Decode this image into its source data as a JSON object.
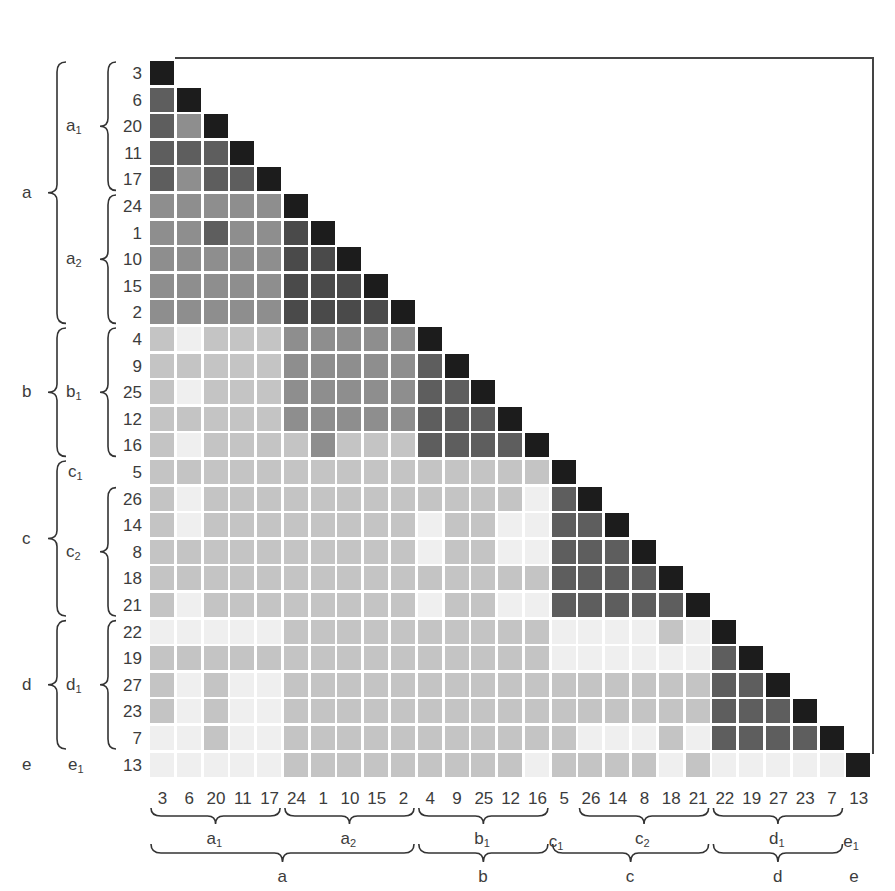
{
  "chart_data": {
    "type": "heatmap",
    "title": "",
    "subtitle": "",
    "order": [
      "3",
      "6",
      "20",
      "11",
      "17",
      "24",
      "1",
      "10",
      "15",
      "2",
      "4",
      "9",
      "25",
      "12",
      "16",
      "5",
      "26",
      "14",
      "8",
      "18",
      "21",
      "22",
      "19",
      "27",
      "23",
      "7",
      "13"
    ],
    "row_labels": [
      "3",
      "6",
      "20",
      "11",
      "17",
      "24",
      "1",
      "10",
      "15",
      "2",
      "4",
      "9",
      "25",
      "12",
      "16",
      "5",
      "26",
      "14",
      "8",
      "18",
      "21",
      "22",
      "19",
      "27",
      "23",
      "7",
      "13"
    ],
    "col_labels": [
      "3",
      "6",
      "20",
      "11",
      "17",
      "24",
      "1",
      "10",
      "15",
      "2",
      "4",
      "9",
      "25",
      "12",
      "16",
      "5",
      "26",
      "14",
      "8",
      "18",
      "21",
      "22",
      "19",
      "27",
      "23",
      "7",
      "13"
    ],
    "shade_scale": {
      "0": "#efefef",
      "1": "#c4c4c4",
      "3": "#8e8e8e",
      "4": "#5e5e5e",
      "5": "#4a4a4a",
      "6": "#1c1c1c"
    },
    "shade_legend": [
      "0 = lowest similarity (near white)",
      "1 = low",
      "3 = medium",
      "4 = high",
      "5 = very high",
      "6 = diagonal (self)"
    ],
    "values": [
      [
        6
      ],
      [
        4,
        6
      ],
      [
        4,
        3,
        6
      ],
      [
        4,
        4,
        4,
        6
      ],
      [
        4,
        3,
        4,
        4,
        6
      ],
      [
        3,
        3,
        3,
        3,
        3,
        6
      ],
      [
        3,
        3,
        4,
        3,
        3,
        5,
        6
      ],
      [
        3,
        3,
        3,
        3,
        3,
        5,
        5,
        6
      ],
      [
        3,
        3,
        3,
        3,
        3,
        5,
        5,
        5,
        6
      ],
      [
        3,
        3,
        3,
        3,
        3,
        5,
        5,
        5,
        5,
        6
      ],
      [
        1,
        0,
        1,
        1,
        1,
        3,
        3,
        3,
        3,
        3,
        6
      ],
      [
        1,
        1,
        1,
        1,
        1,
        3,
        3,
        3,
        3,
        3,
        4,
        6
      ],
      [
        1,
        0,
        1,
        1,
        1,
        3,
        3,
        3,
        3,
        3,
        4,
        4,
        6
      ],
      [
        1,
        1,
        1,
        1,
        1,
        3,
        3,
        3,
        3,
        3,
        4,
        4,
        4,
        6
      ],
      [
        1,
        0,
        1,
        1,
        1,
        1,
        3,
        1,
        1,
        1,
        4,
        4,
        4,
        4,
        6
      ],
      [
        1,
        1,
        1,
        1,
        1,
        1,
        1,
        1,
        1,
        1,
        1,
        1,
        1,
        1,
        1,
        6
      ],
      [
        1,
        0,
        1,
        1,
        1,
        1,
        1,
        1,
        1,
        1,
        1,
        1,
        1,
        1,
        0,
        4,
        6
      ],
      [
        1,
        0,
        1,
        1,
        1,
        1,
        1,
        1,
        1,
        1,
        0,
        1,
        1,
        0,
        0,
        4,
        4,
        6
      ],
      [
        1,
        1,
        1,
        1,
        1,
        1,
        1,
        1,
        1,
        1,
        0,
        1,
        1,
        0,
        0,
        4,
        4,
        4,
        6
      ],
      [
        1,
        1,
        1,
        1,
        1,
        1,
        1,
        1,
        1,
        1,
        1,
        1,
        1,
        1,
        1,
        4,
        4,
        4,
        4,
        6
      ],
      [
        1,
        0,
        1,
        1,
        1,
        1,
        1,
        1,
        1,
        1,
        0,
        1,
        1,
        0,
        0,
        4,
        4,
        4,
        4,
        4,
        6
      ],
      [
        0,
        0,
        0,
        0,
        0,
        1,
        1,
        1,
        1,
        1,
        1,
        1,
        1,
        1,
        1,
        0,
        0,
        0,
        0,
        1,
        0,
        6
      ],
      [
        1,
        1,
        1,
        1,
        1,
        1,
        1,
        1,
        1,
        1,
        1,
        1,
        1,
        1,
        1,
        0,
        0,
        0,
        0,
        0,
        0,
        4,
        6
      ],
      [
        1,
        0,
        1,
        0,
        0,
        1,
        1,
        1,
        1,
        1,
        1,
        1,
        1,
        1,
        1,
        1,
        1,
        1,
        1,
        1,
        1,
        4,
        4,
        6
      ],
      [
        1,
        0,
        1,
        0,
        0,
        1,
        1,
        1,
        1,
        1,
        1,
        1,
        1,
        1,
        1,
        1,
        1,
        1,
        1,
        1,
        1,
        4,
        4,
        4,
        6
      ],
      [
        0,
        0,
        1,
        0,
        0,
        1,
        1,
        1,
        1,
        1,
        1,
        1,
        1,
        1,
        1,
        1,
        0,
        0,
        0,
        1,
        0,
        4,
        4,
        4,
        4,
        6
      ],
      [
        0,
        0,
        0,
        0,
        0,
        1,
        1,
        1,
        1,
        1,
        1,
        1,
        1,
        1,
        0,
        1,
        1,
        1,
        1,
        0,
        1,
        0,
        0,
        0,
        0,
        0,
        6
      ]
    ],
    "groups": [
      {
        "name": "a",
        "start": 0,
        "end": 9
      },
      {
        "name": "b",
        "start": 10,
        "end": 14
      },
      {
        "name": "c",
        "start": 15,
        "end": 20
      },
      {
        "name": "d",
        "start": 21,
        "end": 25
      },
      {
        "name": "e",
        "start": 26,
        "end": 26
      }
    ],
    "subgroups": [
      {
        "name": "a",
        "sub": "1",
        "start": 0,
        "end": 4
      },
      {
        "name": "a",
        "sub": "2",
        "start": 5,
        "end": 9
      },
      {
        "name": "b",
        "sub": "1",
        "start": 10,
        "end": 14
      },
      {
        "name": "c",
        "sub": "1",
        "start": 15,
        "end": 15
      },
      {
        "name": "c",
        "sub": "2",
        "start": 16,
        "end": 20
      },
      {
        "name": "d",
        "sub": "1",
        "start": 21,
        "end": 25
      },
      {
        "name": "e",
        "sub": "1",
        "start": 26,
        "end": 26
      }
    ],
    "xlabel": "",
    "ylabel": "",
    "grid": false,
    "legend_position": "none"
  },
  "layout": {
    "x0": 150,
    "y0": 61,
    "col_pitch": 26.78,
    "row_pitch": 26.6,
    "cell_size": 24,
    "border": {
      "x1": 175,
      "y_top": 58,
      "x_right": 873,
      "y_bottom": 754
    }
  }
}
